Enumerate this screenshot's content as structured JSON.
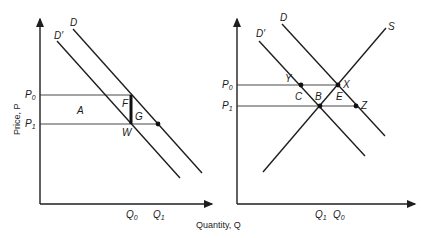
{
  "left_panel": {
    "y_axis_label": "Price, P",
    "x_axis_label": "Quantity, Q",
    "price_labels": {
      "p0": "P",
      "p0_sub": "0",
      "p1": "P",
      "p1_sub": "1"
    },
    "quantity_labels": {
      "q0": "Q",
      "q0_sub": "0",
      "q1": "Q",
      "q1_sub": "1"
    },
    "curves": {
      "d": "D",
      "d_prime": "D′"
    },
    "points": {
      "a": "A",
      "f": "F",
      "g": "G",
      "w": "W"
    }
  },
  "right_panel": {
    "price_labels": {
      "p0": "P",
      "p0_sub": "0",
      "p1": "P",
      "p1_sub": "1"
    },
    "quantity_labels": {
      "q1": "Q",
      "q1_sub": "1",
      "q0": "Q",
      "q0_sub": "0"
    },
    "curves": {
      "d": "D",
      "d_prime": "D′",
      "s": "S"
    },
    "points": {
      "y": "Y",
      "x": "X",
      "c": "C",
      "b": "B",
      "e": "E",
      "z": "Z"
    }
  },
  "colors": {
    "ink": "#1e1e1e",
    "background": "#ffffff"
  }
}
